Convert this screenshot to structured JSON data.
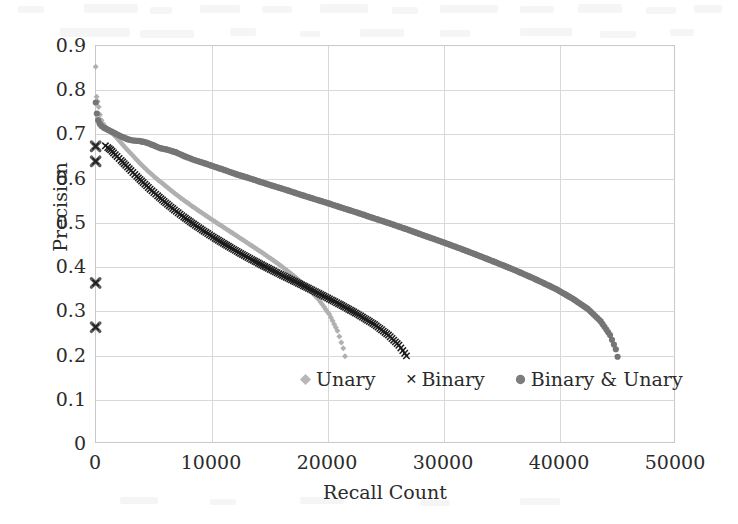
{
  "chart_data": {
    "type": "scatter",
    "title": "",
    "xlabel": "Recall Count",
    "ylabel": "Precision",
    "xlim": [
      0,
      50000
    ],
    "ylim": [
      0,
      0.9
    ],
    "grid": true,
    "legend_position": "inside-bottom-center",
    "xticks": [
      "0",
      "10000",
      "20000",
      "30000",
      "40000",
      "50000"
    ],
    "xtick_values": [
      0,
      10000,
      20000,
      30000,
      40000,
      50000
    ],
    "yticks": [
      "0",
      "0.1",
      "0.2",
      "0.3",
      "0.4",
      "0.5",
      "0.6",
      "0.7",
      "0.8",
      "0.9"
    ],
    "ytick_values": [
      0,
      0.1,
      0.2,
      0.3,
      0.4,
      0.5,
      0.6,
      0.7,
      0.8,
      0.9
    ],
    "series": [
      {
        "name": "Unary",
        "marker": "diamond",
        "color": "#b0b0b0",
        "x": [
          60,
          140,
          230,
          320,
          430,
          560,
          700,
          860,
          1050,
          1250,
          1500,
          1800,
          2150,
          2550,
          3000,
          3500,
          4050,
          4650,
          5300,
          6000,
          6750,
          7550,
          8400,
          9300,
          10250,
          11250,
          12300,
          13400,
          14550,
          15750,
          17000,
          18300,
          19300,
          20200,
          20900,
          21400,
          21550
        ],
        "y": [
          0.851,
          0.783,
          0.772,
          0.76,
          0.742,
          0.73,
          0.722,
          0.716,
          0.71,
          0.706,
          0.7,
          0.692,
          0.682,
          0.67,
          0.657,
          0.643,
          0.628,
          0.613,
          0.598,
          0.583,
          0.567,
          0.551,
          0.535,
          0.519,
          0.502,
          0.485,
          0.467,
          0.448,
          0.428,
          0.406,
          0.381,
          0.352,
          0.324,
          0.291,
          0.254,
          0.214,
          0.196
        ]
      },
      {
        "name": "Binary",
        "marker": "x",
        "color": "#1c1c1c",
        "x": [
          55,
          55,
          55,
          55,
          900,
          1100,
          1350,
          1600,
          1900,
          2250,
          2650,
          3100,
          3600,
          4150,
          4750,
          5400,
          6100,
          6850,
          7650,
          8500,
          9400,
          10350,
          11350,
          12400,
          13500,
          14650,
          15850,
          17100,
          18400,
          19750,
          21150,
          22600,
          24100,
          25300,
          26200,
          26700,
          26850
        ],
        "y": [
          0.671,
          0.637,
          0.362,
          0.262,
          0.672,
          0.668,
          0.663,
          0.656,
          0.648,
          0.639,
          0.628,
          0.616,
          0.603,
          0.589,
          0.574,
          0.559,
          0.543,
          0.527,
          0.511,
          0.495,
          0.479,
          0.463,
          0.447,
          0.431,
          0.415,
          0.399,
          0.383,
          0.367,
          0.35,
          0.332,
          0.313,
          0.292,
          0.268,
          0.244,
          0.221,
          0.203,
          0.197
        ]
      },
      {
        "name": "Binary & Unary",
        "marker": "circle",
        "color": "#757575",
        "x": [
          70,
          160,
          270,
          400,
          560,
          760,
          1000,
          1280,
          1600,
          1960,
          2360,
          2800,
          3280,
          3800,
          4360,
          4960,
          5600,
          6280,
          7000,
          7760,
          8560,
          9400,
          10280,
          11200,
          12160,
          13160,
          14200,
          15280,
          16400,
          17560,
          18760,
          20000,
          21280,
          22600,
          23960,
          25360,
          26800,
          28280,
          29800,
          31360,
          32960,
          34600,
          36280,
          38000,
          39760,
          41200,
          42500,
          43600,
          44400,
          44900,
          45050
        ],
        "y": [
          0.77,
          0.745,
          0.73,
          0.722,
          0.717,
          0.713,
          0.71,
          0.706,
          0.702,
          0.697,
          0.692,
          0.687,
          0.684,
          0.683,
          0.68,
          0.674,
          0.667,
          0.663,
          0.657,
          0.648,
          0.64,
          0.633,
          0.625,
          0.617,
          0.608,
          0.6,
          0.591,
          0.582,
          0.573,
          0.563,
          0.553,
          0.543,
          0.532,
          0.521,
          0.509,
          0.497,
          0.484,
          0.47,
          0.456,
          0.441,
          0.425,
          0.408,
          0.39,
          0.37,
          0.348,
          0.326,
          0.303,
          0.275,
          0.244,
          0.212,
          0.195
        ]
      }
    ]
  },
  "axes": {
    "x_title": "Recall Count",
    "y_title": "Precision"
  },
  "legend": {
    "entries": [
      {
        "label": "Unary",
        "marker": "diamond-icon",
        "color": "#b0b0b0"
      },
      {
        "label": "Binary",
        "marker": "cross-icon",
        "color": "#1c1c1c"
      },
      {
        "label": "Binary & Unary",
        "marker": "circle-icon",
        "color": "#757575"
      }
    ]
  }
}
